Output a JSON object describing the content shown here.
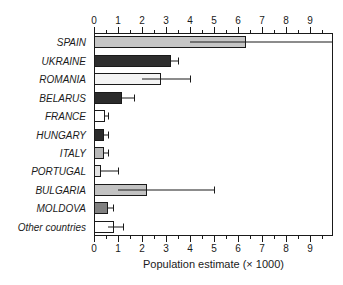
{
  "chart_data": {
    "type": "bar",
    "orientation": "horizontal",
    "title": "",
    "xlabel": "Population estimate (× 1000)",
    "ylabel": "",
    "xlim": [
      0,
      10
    ],
    "xticks": [
      0,
      1,
      2,
      3,
      4,
      5,
      6,
      7,
      8,
      9
    ],
    "xtick_labels": [
      "0",
      "1",
      "2",
      "3",
      "4",
      "5",
      "6",
      "7",
      "8",
      "9"
    ],
    "minor_ticks_per_interval": 2,
    "axis_top": true,
    "axis_bottom": true,
    "grid": false,
    "legend": null,
    "categories": [
      "SPAIN",
      "UKRAINE",
      "ROMANIA",
      "BELARUS",
      "FRANCE",
      "HUNGARY",
      "ITALY",
      "PORTUGAL",
      "BULGARIA",
      "MOLDOVA",
      "Other countries"
    ],
    "values": [
      6.35,
      3.2,
      2.8,
      1.15,
      0.45,
      0.4,
      0.4,
      0.3,
      2.2,
      0.6,
      0.85
    ],
    "error_low": [
      4.0,
      3.2,
      2.0,
      1.15,
      0.45,
      0.4,
      0.4,
      0.3,
      1.0,
      0.6,
      0.6
    ],
    "error_high": [
      10.0,
      3.5,
      4.0,
      1.65,
      0.6,
      0.6,
      0.6,
      1.0,
      5.0,
      0.8,
      1.2
    ],
    "bar_colors": [
      "#c6c6c6",
      "#2e2e2e",
      "#f4f4f4",
      "#2b2b2b",
      "#ffffff",
      "#2b2b2b",
      "#b8b8b8",
      "#e3e3e3",
      "#c2c2c2",
      "#808080",
      "#ffffff"
    ],
    "bar_edge_color": "#1a1a1a",
    "error_color": "#1a1a1a"
  }
}
